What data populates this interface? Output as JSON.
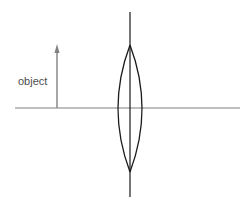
{
  "diagram": {
    "background_color": "#ffffff",
    "width": 247,
    "height": 205
  },
  "labels": {
    "object_label": "object"
  },
  "colors": {
    "optical_axis": "#808080",
    "lens_plane_axis": "#1a1a1a",
    "lens_outline": "#1a1a1a",
    "object_ray": "#808080",
    "label_text": "#4d4d4d",
    "background": "#ffffff"
  },
  "chart_data": {
    "type": "diagram",
    "xlabel": "",
    "ylabel": "",
    "elements": [
      {
        "name": "optical-axis",
        "kind": "horizontal-line",
        "x1": 15,
        "y1": 108,
        "x2": 240,
        "y2": 108,
        "color": "#808080",
        "stroke_width": 1.1
      },
      {
        "name": "lens-plane-axis",
        "kind": "vertical-line",
        "x1": 130,
        "y1": 12,
        "x2": 130,
        "y2": 197,
        "color": "#1a1a1a",
        "stroke_width": 1.2
      },
      {
        "name": "lens-left-arc",
        "kind": "arc",
        "top": [
          130,
          45
        ],
        "bottom": [
          130,
          172
        ],
        "bulge_x": 118,
        "color": "#1a1a1a",
        "stroke_width": 1.3
      },
      {
        "name": "lens-right-arc",
        "kind": "arc",
        "top": [
          130,
          45
        ],
        "bottom": [
          130,
          172
        ],
        "bulge_x": 142,
        "color": "#1a1a1a",
        "stroke_width": 1.3
      },
      {
        "name": "object-arrow",
        "kind": "arrow",
        "x": 57,
        "base_y": 108,
        "tip_y": 45,
        "color": "#808080",
        "stroke_width": 1.4,
        "head_width": 5,
        "head_height": 9
      },
      {
        "name": "object-label",
        "kind": "text",
        "text": "object",
        "x": 18,
        "y": 85,
        "color": "#4d4d4d",
        "font_size": 11
      }
    ],
    "lens_type": "biconvex converging lens",
    "lens_center": [
      130,
      108
    ],
    "lens_half_height": 63,
    "lens_half_thickness": 12
  }
}
